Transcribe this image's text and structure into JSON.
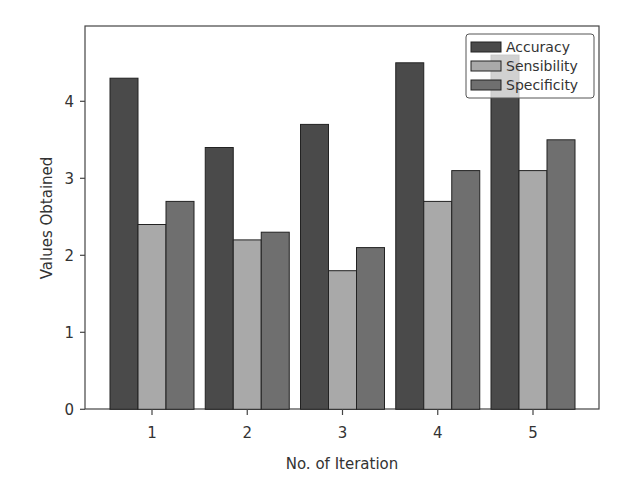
{
  "chart_data": {
    "type": "bar",
    "title": "",
    "xlabel": "No. of Iteration",
    "ylabel": "Values Obtained",
    "categories": [
      "1",
      "2",
      "3",
      "4",
      "5"
    ],
    "series": [
      {
        "name": "Accuracy",
        "color": "#4a4a4a",
        "values": [
          4.3,
          3.4,
          3.7,
          4.5,
          4.6
        ]
      },
      {
        "name": "Sensibility",
        "color": "#a9a9a9",
        "values": [
          2.4,
          2.2,
          1.8,
          2.7,
          3.1
        ]
      },
      {
        "name": "Specificity",
        "color": "#6f6f6f",
        "values": [
          2.7,
          2.3,
          2.1,
          3.1,
          3.5
        ]
      }
    ],
    "yticks": [
      0,
      1,
      2,
      3,
      4
    ],
    "ylim": [
      0,
      5.0
    ],
    "grid": false,
    "legend_position": "upper right"
  }
}
